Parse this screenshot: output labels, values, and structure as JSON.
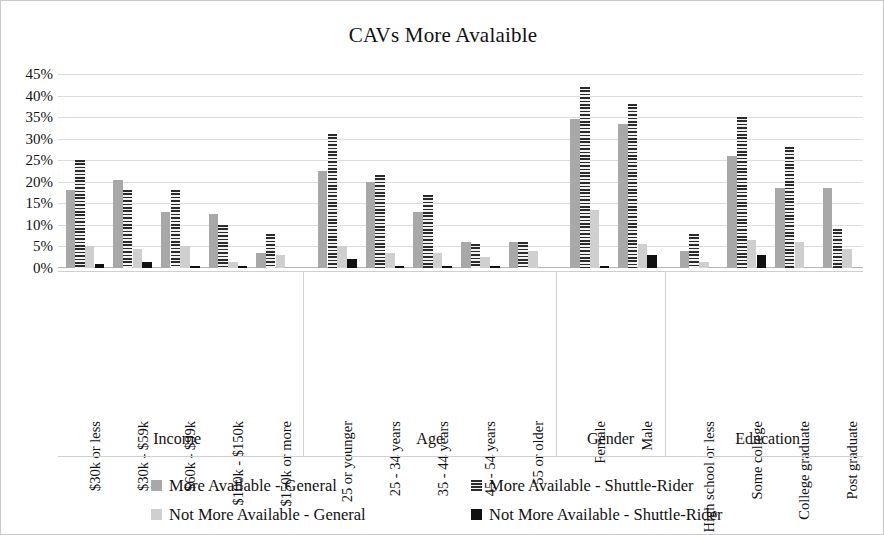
{
  "chart_data": {
    "type": "bar",
    "title": "CAVs More Avalaible",
    "xlabel": "",
    "ylabel": "",
    "ylim": [
      0,
      45
    ],
    "ytick_labels": [
      "45%",
      "40%",
      "35%",
      "30%",
      "25%",
      "20%",
      "15%",
      "10%",
      "5%",
      "0%"
    ],
    "ytick_values": [
      45,
      40,
      35,
      30,
      25,
      20,
      15,
      10,
      5,
      0
    ],
    "grid": true,
    "legend_position": "bottom",
    "groups": [
      {
        "label": "Income",
        "categories": [
          "$30k or less",
          "$30k - $59k",
          "$60k - $99k",
          "$100k - $150k",
          "$150k or more"
        ]
      },
      {
        "label": "Age",
        "categories": [
          "25 or younger",
          "25 - 34 years",
          "35 - 44 years",
          "45 - 54 years",
          "55 or older"
        ]
      },
      {
        "label": "Gender",
        "categories": [
          "Female",
          "Male"
        ]
      },
      {
        "label": "Education",
        "categories": [
          "High school or less",
          "Some college",
          "College graduate",
          "Post graduate"
        ]
      }
    ],
    "categories": [
      "$30k or less",
      "$30k - $59k",
      "$60k - $99k",
      "$100k - $150k",
      "$150k or more",
      "25 or younger",
      "25 - 34 years",
      "35 - 44 years",
      "45 - 54 years",
      "55 or older",
      "Female",
      "Male",
      "High school or less",
      "Some college",
      "College graduate",
      "Post graduate"
    ],
    "series": [
      {
        "name": "More Available - General",
        "color": "#a8a8a8",
        "values": [
          18,
          20.5,
          13,
          12.5,
          3.5,
          22.5,
          20,
          13,
          6,
          6,
          34.5,
          33.5,
          4,
          26,
          18.5,
          18.5
        ]
      },
      {
        "name": "More Available - Shuttle-Rider",
        "color": "#2b2b2b",
        "values": [
          25,
          18,
          18,
          10,
          8,
          31,
          21.5,
          17,
          5.5,
          6,
          42,
          38,
          8,
          35,
          28,
          9
        ]
      },
      {
        "name": "Not More Available - General",
        "color": "#cfcfcf",
        "values": [
          5,
          4.5,
          5,
          1.5,
          3,
          5,
          3.5,
          3.5,
          2.5,
          4,
          13.5,
          5.5,
          1.5,
          6.5,
          6,
          4.5
        ]
      },
      {
        "name": "Not More Available - Shuttle-Rider",
        "color": "#101010",
        "values": [
          1,
          1.5,
          0.5,
          0.5,
          0,
          2,
          0.5,
          0.5,
          0.5,
          0,
          0.5,
          3,
          0,
          3,
          0,
          0
        ]
      }
    ]
  },
  "legend": {
    "items": [
      "More Available - General",
      "More Available - Shuttle-Rider",
      "Not More Available - General",
      "Not More Available - Shuttle-Rider"
    ]
  }
}
